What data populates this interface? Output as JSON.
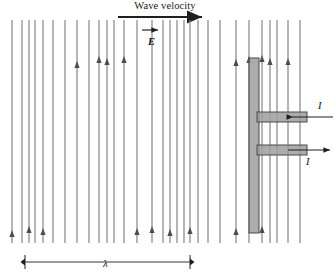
{
  "figure": {
    "title": "Wave velocity",
    "width": 334,
    "height": 278,
    "background": "#ffffff",
    "line_color": "#7a7a7a",
    "arrow_color": "#4d4d4d",
    "antenna_fill": "#9e9e9e",
    "antenna_stroke": "#4a4a4a",
    "text_color": "#111111"
  },
  "labels": {
    "wave_velocity": "Wave velocity",
    "electric_field": "E",
    "current_upper": "I",
    "current_lower": "I",
    "wavelength": "λ"
  },
  "chart_data": {
    "type": "diagram",
    "title": "Wave velocity",
    "annotations": [
      "Wave velocity",
      "E",
      "I",
      "I",
      "λ"
    ],
    "wave_velocity_arrow": {
      "x_start": 118,
      "x_end": 208,
      "y": 17,
      "direction": "right"
    },
    "field_region": {
      "y_top": 20,
      "y_bottom": 243
    },
    "e_vector": {
      "label": "E",
      "label_x": 148,
      "label_y": 36,
      "arrow_x_start": 142,
      "arrow_x_end": 158,
      "arrow_y": 30,
      "direction": "right"
    },
    "wavelength_marker": {
      "label": "λ",
      "x_left": 25,
      "x_right": 190,
      "y": 262,
      "tick_height": 7,
      "label_x": 103,
      "label_y": 257
    },
    "field_lines": [
      {
        "x": 12,
        "arrow": false,
        "arrow_y": null
      },
      {
        "x": 22,
        "arrow": false,
        "arrow_y": null
      },
      {
        "x": 29,
        "arrow": false,
        "arrow_y": null
      },
      {
        "x": 35,
        "arrow": false,
        "arrow_y": null
      },
      {
        "x": 43,
        "arrow": false,
        "arrow_y": null
      },
      {
        "x": 53,
        "arrow": false,
        "arrow_y": null
      },
      {
        "x": 65,
        "arrow": false,
        "arrow_y": null
      },
      {
        "x": 77,
        "arrow": true,
        "arrow_y": 63
      },
      {
        "x": 89,
        "arrow": false,
        "arrow_y": null
      },
      {
        "x": 99,
        "arrow": true,
        "arrow_y": 58
      },
      {
        "x": 107,
        "arrow": true,
        "arrow_y": 60
      },
      {
        "x": 114,
        "arrow": false,
        "arrow_y": null
      },
      {
        "x": 124,
        "arrow": true,
        "arrow_y": 58
      },
      {
        "x": 137,
        "arrow": false,
        "arrow_y": null
      },
      {
        "x": 152,
        "arrow": false,
        "arrow_y": null
      },
      {
        "x": 163,
        "arrow": false,
        "arrow_y": null
      },
      {
        "x": 170,
        "arrow": false,
        "arrow_y": null
      },
      {
        "x": 177,
        "arrow": false,
        "arrow_y": null
      },
      {
        "x": 184,
        "arrow": false,
        "arrow_y": null
      },
      {
        "x": 190,
        "arrow": false,
        "arrow_y": null
      },
      {
        "x": 198,
        "arrow": false,
        "arrow_y": null
      },
      {
        "x": 208,
        "arrow": false,
        "arrow_y": null
      },
      {
        "x": 220,
        "arrow": false,
        "arrow_y": null
      },
      {
        "x": 236,
        "arrow": true,
        "arrow_y": 61
      },
      {
        "x": 249,
        "arrow": true,
        "arrow_y": 58
      },
      {
        "x": 262,
        "arrow": true,
        "arrow_y": 57
      },
      {
        "x": 270,
        "arrow": true,
        "arrow_y": 60
      },
      {
        "x": 277,
        "arrow": false,
        "arrow_y": null
      },
      {
        "x": 288,
        "arrow": true,
        "arrow_y": 60
      },
      {
        "x": 300,
        "arrow": false,
        "arrow_y": null
      }
    ],
    "bottom_arrows": [
      {
        "x": 12,
        "arrow_y": 232
      },
      {
        "x": 29,
        "arrow_y": 228
      },
      {
        "x": 43,
        "arrow_y": 230
      },
      {
        "x": 137,
        "arrow_y": 230
      },
      {
        "x": 152,
        "arrow_y": 228
      },
      {
        "x": 170,
        "arrow_y": 231
      },
      {
        "x": 190,
        "arrow_y": 229
      },
      {
        "x": 236,
        "arrow_y": 230
      },
      {
        "x": 262,
        "arrow_y": 228
      }
    ],
    "antenna": {
      "vertical_bar": {
        "x": 249,
        "y": 58,
        "width": 10,
        "height": 175
      },
      "upper_arm": {
        "x": 257,
        "y": 112,
        "width": 50,
        "height": 10
      },
      "lower_arm": {
        "x": 257,
        "y": 145,
        "width": 50,
        "height": 10
      }
    },
    "current_arrows": [
      {
        "label": "I",
        "x_start": 333,
        "x_end": 292,
        "y": 117,
        "direction": "left",
        "label_x": 318,
        "label_y": 100
      },
      {
        "label": "I",
        "x_start": 288,
        "x_end": 330,
        "y": 150,
        "direction": "right",
        "label_x": 306,
        "label_y": 156
      }
    ]
  }
}
